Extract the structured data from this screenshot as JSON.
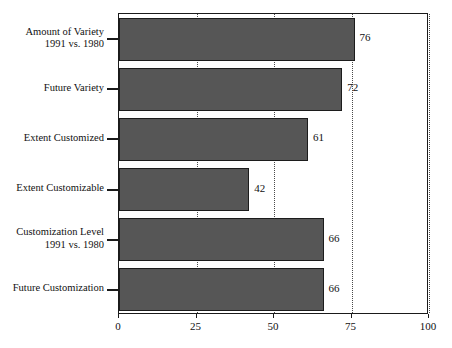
{
  "chart_data": {
    "type": "bar",
    "orientation": "horizontal",
    "title": "",
    "xlabel": "",
    "ylabel": "",
    "xlim": [
      0,
      100
    ],
    "xticks": [
      0,
      25,
      50,
      75,
      100
    ],
    "xtick_labels": [
      "0",
      "25",
      "50",
      "75",
      "100"
    ],
    "grid": "vertical-dotted",
    "legend": "none",
    "categories": [
      "Amount of Variety\n1991 vs. 1980",
      "Future Variety",
      "Extent Customized",
      "Extent Customizable",
      "Customization Level\n1991 vs. 1980",
      "Future Customization"
    ],
    "values": [
      76,
      72,
      61,
      42,
      66,
      66
    ],
    "data_labels": [
      "76",
      "72",
      "61",
      "42",
      "66",
      "66"
    ],
    "bar_color": "#565656",
    "bar_edge_color": "#1c1c1c",
    "frame_color": "#1a1a1a",
    "background": "#ffffff"
  },
  "axis": {
    "x_tick_labels": [
      "0",
      "25",
      "50",
      "75",
      "100"
    ]
  },
  "categories": [
    {
      "line1": "Amount of Variety",
      "line2": "1991 vs. 1980",
      "value_label": "76"
    },
    {
      "line1": "Future Variety",
      "line2": "",
      "value_label": "72"
    },
    {
      "line1": "Extent Customized",
      "line2": "",
      "value_label": "61"
    },
    {
      "line1": "Extent Customizable",
      "line2": "",
      "value_label": "42"
    },
    {
      "line1": "Customization Level",
      "line2": "1991 vs. 1980",
      "value_label": "66"
    },
    {
      "line1": "Future Customization",
      "line2": "",
      "value_label": "66"
    }
  ]
}
